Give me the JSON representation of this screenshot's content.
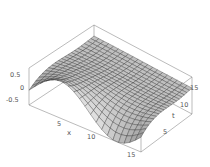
{
  "chart_data": {
    "type": "surface3d",
    "title": "",
    "xlabel": "x",
    "ylabel": "t",
    "zlabel": "",
    "xlim": [
      0,
      16
    ],
    "ylim": [
      0,
      16
    ],
    "zlim": [
      -0.75,
      0.75
    ],
    "x_ticks": [
      "5",
      "10",
      "15"
    ],
    "y_ticks": [
      "5",
      "10",
      "15"
    ],
    "z_ticks": [
      "0.5",
      "0",
      "-0.5"
    ],
    "grid_lines_per_axis": 20,
    "mesh_color": "#2a2a2a",
    "surface_color_light": "#e6e6e6",
    "surface_color_dark": "#8a8a8a",
    "box_color": "#777777"
  },
  "labels": {
    "x_axis": "x",
    "t_axis": "t",
    "x_tick_5": "5",
    "x_tick_10": "10",
    "x_tick_15": "15",
    "t_tick_5": "5",
    "t_tick_10": "10",
    "t_tick_15": "15",
    "z_tick_pos": "0.5",
    "z_tick_zero": "0",
    "z_tick_neg": "-0.5"
  }
}
